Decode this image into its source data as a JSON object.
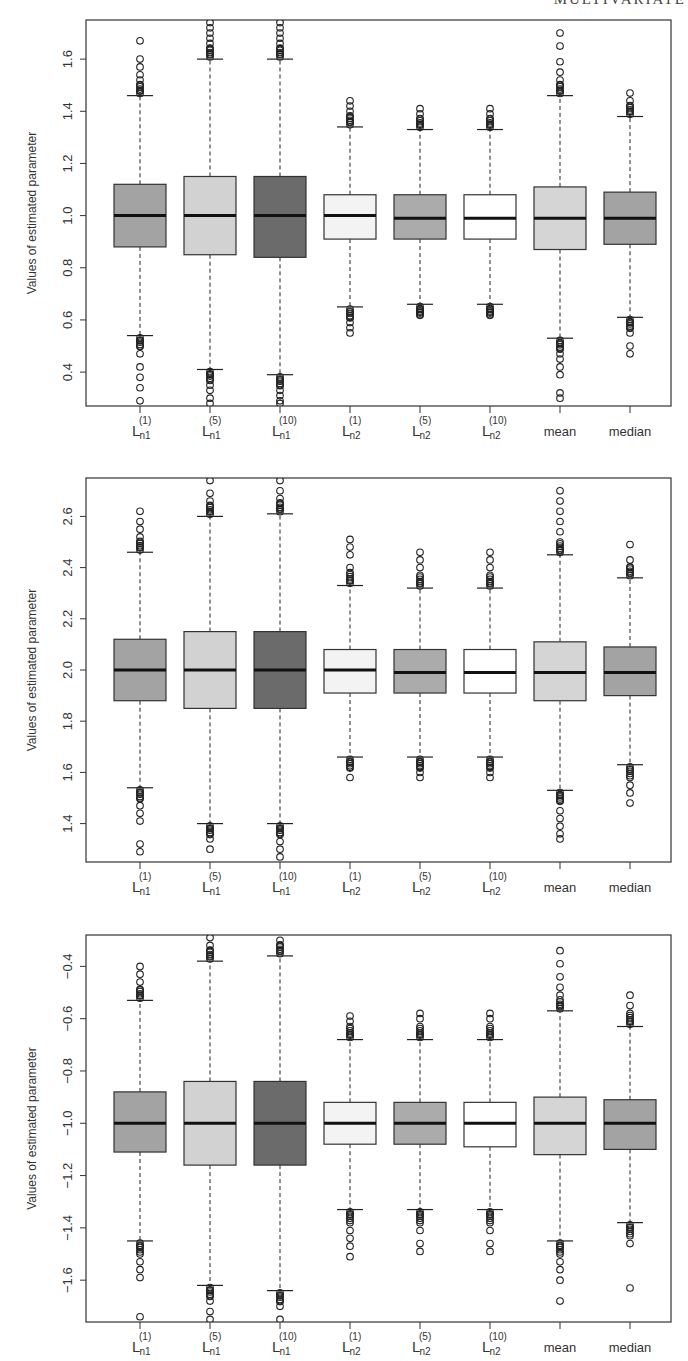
{
  "page": {
    "running_head": "MULTIVARIATE"
  },
  "chart_data": [
    {
      "type": "boxplot",
      "title": "",
      "xlabel": "",
      "ylabel": "Values of estimated parameter",
      "ylim": [
        0.27,
        1.75
      ],
      "yticks": [
        0.4,
        0.6,
        0.8,
        1.0,
        1.2,
        1.4,
        1.6
      ],
      "ytick_labels": [
        "0.4",
        "0.6",
        "0.8",
        "1.0",
        "1.2",
        "1.4",
        "1.6"
      ],
      "categories": [
        "L_n1^(1)",
        "L_n1^(5)",
        "L_n1^(10)",
        "L_n2^(1)",
        "L_n2^(5)",
        "L_n2^(10)",
        "mean",
        "median"
      ],
      "fills": [
        "#a3a3a3",
        "#d2d2d2",
        "#6b6b6b",
        "#f3f3f3",
        "#ababab",
        "#ffffff",
        "#d5d5d5",
        "#a3a3a3"
      ],
      "boxes": [
        {
          "whislo": 0.54,
          "q1": 0.88,
          "med": 1.0,
          "q3": 1.12,
          "whishi": 1.46,
          "out_lo": [
            0.52,
            0.5,
            0.47,
            0.42,
            0.38,
            0.34,
            0.29
          ],
          "out_hi": [
            1.48,
            1.5,
            1.52,
            1.54,
            1.57,
            1.6,
            1.67
          ]
        },
        {
          "whislo": 0.41,
          "q1": 0.85,
          "med": 1.0,
          "q3": 1.15,
          "whishi": 1.6,
          "out_lo": [
            0.39,
            0.37,
            0.35,
            0.33,
            0.3,
            0.28
          ],
          "out_hi": [
            1.62,
            1.64,
            1.66,
            1.68,
            1.7,
            1.72,
            1.74
          ]
        },
        {
          "whislo": 0.39,
          "q1": 0.84,
          "med": 1.0,
          "q3": 1.15,
          "whishi": 1.6,
          "out_lo": [
            0.37,
            0.35,
            0.33,
            0.31,
            0.29,
            0.28
          ],
          "out_hi": [
            1.62,
            1.64,
            1.66,
            1.68,
            1.7,
            1.72,
            1.74
          ]
        },
        {
          "whislo": 0.65,
          "q1": 0.91,
          "med": 1.0,
          "q3": 1.08,
          "whishi": 1.34,
          "out_lo": [
            0.63,
            0.61,
            0.59,
            0.57,
            0.55
          ],
          "out_hi": [
            1.36,
            1.38,
            1.4,
            1.42,
            1.44
          ]
        },
        {
          "whislo": 0.66,
          "q1": 0.91,
          "med": 0.99,
          "q3": 1.08,
          "whishi": 1.33,
          "out_lo": [
            0.64,
            0.63,
            0.62
          ],
          "out_hi": [
            1.35,
            1.37,
            1.39,
            1.41
          ]
        },
        {
          "whislo": 0.66,
          "q1": 0.91,
          "med": 0.99,
          "q3": 1.08,
          "whishi": 1.33,
          "out_lo": [
            0.64,
            0.63,
            0.62
          ],
          "out_hi": [
            1.35,
            1.37,
            1.39,
            1.41
          ]
        },
        {
          "whislo": 0.53,
          "q1": 0.87,
          "med": 0.99,
          "q3": 1.11,
          "whishi": 1.46,
          "out_lo": [
            0.51,
            0.49,
            0.47,
            0.45,
            0.42,
            0.39,
            0.32,
            0.3
          ],
          "out_hi": [
            1.48,
            1.5,
            1.52,
            1.55,
            1.59,
            1.65,
            1.7
          ]
        },
        {
          "whislo": 0.61,
          "q1": 0.89,
          "med": 0.99,
          "q3": 1.09,
          "whishi": 1.38,
          "out_lo": [
            0.59,
            0.57,
            0.55,
            0.5,
            0.47
          ],
          "out_hi": [
            1.4,
            1.42,
            1.44,
            1.47
          ]
        }
      ]
    },
    {
      "type": "boxplot",
      "title": "",
      "xlabel": "",
      "ylabel": "Values of estimated parameter",
      "ylim": [
        1.25,
        2.75
      ],
      "yticks": [
        1.4,
        1.6,
        1.8,
        2.0,
        2.2,
        2.4,
        2.6
      ],
      "ytick_labels": [
        "1.4",
        "1.6",
        "1.8",
        "2.0",
        "2.2",
        "2.4",
        "2.6"
      ],
      "categories": [
        "L_n1^(1)",
        "L_n1^(5)",
        "L_n1^(10)",
        "L_n2^(1)",
        "L_n2^(5)",
        "L_n2^(10)",
        "mean",
        "median"
      ],
      "fills": [
        "#a3a3a3",
        "#d2d2d2",
        "#6b6b6b",
        "#f3f3f3",
        "#ababab",
        "#ffffff",
        "#d5d5d5",
        "#a3a3a3"
      ],
      "boxes": [
        {
          "whislo": 1.54,
          "q1": 1.88,
          "med": 2.0,
          "q3": 2.12,
          "whishi": 2.46,
          "out_lo": [
            1.52,
            1.5,
            1.47,
            1.44,
            1.41,
            1.32,
            1.29
          ],
          "out_hi": [
            2.48,
            2.5,
            2.52,
            2.55,
            2.58,
            2.62
          ]
        },
        {
          "whislo": 1.4,
          "q1": 1.85,
          "med": 2.0,
          "q3": 2.15,
          "whishi": 2.6,
          "out_lo": [
            1.38,
            1.36,
            1.34,
            1.3
          ],
          "out_hi": [
            2.62,
            2.64,
            2.66,
            2.69,
            2.74
          ]
        },
        {
          "whislo": 1.4,
          "q1": 1.85,
          "med": 2.0,
          "q3": 2.15,
          "whishi": 2.61,
          "out_lo": [
            1.38,
            1.36,
            1.33,
            1.3,
            1.27
          ],
          "out_hi": [
            2.63,
            2.65,
            2.67,
            2.7,
            2.74
          ]
        },
        {
          "whislo": 1.66,
          "q1": 1.91,
          "med": 2.0,
          "q3": 2.08,
          "whishi": 2.33,
          "out_lo": [
            1.64,
            1.62,
            1.58
          ],
          "out_hi": [
            2.35,
            2.38,
            2.4,
            2.45,
            2.48,
            2.51
          ]
        },
        {
          "whislo": 1.66,
          "q1": 1.91,
          "med": 1.99,
          "q3": 2.08,
          "whishi": 2.32,
          "out_lo": [
            1.64,
            1.62,
            1.6,
            1.58
          ],
          "out_hi": [
            2.34,
            2.37,
            2.4,
            2.43,
            2.46
          ]
        },
        {
          "whislo": 1.66,
          "q1": 1.91,
          "med": 1.99,
          "q3": 2.08,
          "whishi": 2.32,
          "out_lo": [
            1.64,
            1.62,
            1.6,
            1.58
          ],
          "out_hi": [
            2.34,
            2.37,
            2.4,
            2.43,
            2.46
          ]
        },
        {
          "whislo": 1.53,
          "q1": 1.88,
          "med": 1.99,
          "q3": 2.11,
          "whishi": 2.45,
          "out_lo": [
            1.51,
            1.49,
            1.45,
            1.42,
            1.39,
            1.36,
            1.34
          ],
          "out_hi": [
            2.47,
            2.5,
            2.54,
            2.58,
            2.62,
            2.66,
            2.7
          ]
        },
        {
          "whislo": 1.63,
          "q1": 1.9,
          "med": 1.99,
          "q3": 2.09,
          "whishi": 2.36,
          "out_lo": [
            1.61,
            1.58,
            1.55,
            1.52,
            1.48
          ],
          "out_hi": [
            2.38,
            2.4,
            2.43,
            2.49
          ]
        }
      ]
    },
    {
      "type": "boxplot",
      "title": "",
      "xlabel": "",
      "ylabel": "Values of estimated parameter",
      "ylim": [
        -1.76,
        -0.28
      ],
      "yticks": [
        -1.6,
        -1.4,
        -1.2,
        -1.0,
        -0.8,
        -0.6,
        -0.4
      ],
      "ytick_labels": [
        "−1.6",
        "−1.4",
        "−1.2",
        "−1.0",
        "−0.8",
        "−0.6",
        "−0.4"
      ],
      "categories": [
        "L_n1^(1)",
        "L_n1^(5)",
        "L_n1^(10)",
        "L_n2^(1)",
        "L_n2^(5)",
        "L_n2^(10)",
        "mean",
        "median"
      ],
      "fills": [
        "#a3a3a3",
        "#d2d2d2",
        "#6b6b6b",
        "#f3f3f3",
        "#ababab",
        "#ffffff",
        "#d5d5d5",
        "#a3a3a3"
      ],
      "boxes": [
        {
          "whislo": -1.45,
          "q1": -1.11,
          "med": -1.0,
          "q3": -0.88,
          "whishi": -0.53,
          "out_lo": [
            -1.47,
            -1.5,
            -1.53,
            -1.56,
            -1.59,
            -1.74
          ],
          "out_hi": [
            -0.51,
            -0.49,
            -0.46,
            -0.43,
            -0.4
          ]
        },
        {
          "whislo": -1.62,
          "q1": -1.16,
          "med": -1.0,
          "q3": -0.84,
          "whishi": -0.38,
          "out_lo": [
            -1.64,
            -1.66,
            -1.68,
            -1.72,
            -1.75
          ],
          "out_hi": [
            -0.36,
            -0.34,
            -0.32,
            -0.29
          ]
        },
        {
          "whislo": -1.64,
          "q1": -1.16,
          "med": -1.0,
          "q3": -0.84,
          "whishi": -0.36,
          "out_lo": [
            -1.66,
            -1.68,
            -1.7,
            -1.75
          ],
          "out_hi": [
            -0.34,
            -0.32,
            -0.3
          ]
        },
        {
          "whislo": -1.33,
          "q1": -1.08,
          "med": -1.0,
          "q3": -0.92,
          "whishi": -0.68,
          "out_lo": [
            -1.35,
            -1.38,
            -1.41,
            -1.44,
            -1.47,
            -1.51
          ],
          "out_hi": [
            -0.66,
            -0.63,
            -0.61,
            -0.59
          ]
        },
        {
          "whislo": -1.33,
          "q1": -1.08,
          "med": -1.0,
          "q3": -0.92,
          "whishi": -0.68,
          "out_lo": [
            -1.35,
            -1.38,
            -1.41,
            -1.46,
            -1.49
          ],
          "out_hi": [
            -0.66,
            -0.63,
            -0.6,
            -0.58
          ]
        },
        {
          "whislo": -1.33,
          "q1": -1.09,
          "med": -1.0,
          "q3": -0.92,
          "whishi": -0.68,
          "out_lo": [
            -1.35,
            -1.38,
            -1.41,
            -1.46,
            -1.49
          ],
          "out_hi": [
            -0.66,
            -0.63,
            -0.6,
            -0.58
          ]
        },
        {
          "whislo": -1.45,
          "q1": -1.12,
          "med": -1.0,
          "q3": -0.9,
          "whishi": -0.57,
          "out_lo": [
            -1.47,
            -1.5,
            -1.53,
            -1.56,
            -1.6,
            -1.68
          ],
          "out_hi": [
            -0.55,
            -0.51,
            -0.48,
            -0.44,
            -0.39,
            -0.34
          ]
        },
        {
          "whislo": -1.38,
          "q1": -1.1,
          "med": -1.0,
          "q3": -0.91,
          "whishi": -0.63,
          "out_lo": [
            -1.4,
            -1.43,
            -1.46,
            -1.63
          ],
          "out_hi": [
            -0.61,
            -0.58,
            -0.55,
            -0.51
          ]
        }
      ]
    }
  ],
  "x_labels": [
    {
      "base": "L",
      "sub": "n1",
      "sup": "(1)"
    },
    {
      "base": "L",
      "sub": "n1",
      "sup": "(5)"
    },
    {
      "base": "L",
      "sub": "n1",
      "sup": "(10)"
    },
    {
      "base": "L",
      "sub": "n2",
      "sup": "(1)"
    },
    {
      "base": "L",
      "sub": "n2",
      "sup": "(5)"
    },
    {
      "base": "L",
      "sub": "n2",
      "sup": "(10)"
    },
    {
      "base": "mean",
      "sub": "",
      "sup": ""
    },
    {
      "base": "median",
      "sub": "",
      "sup": ""
    }
  ]
}
